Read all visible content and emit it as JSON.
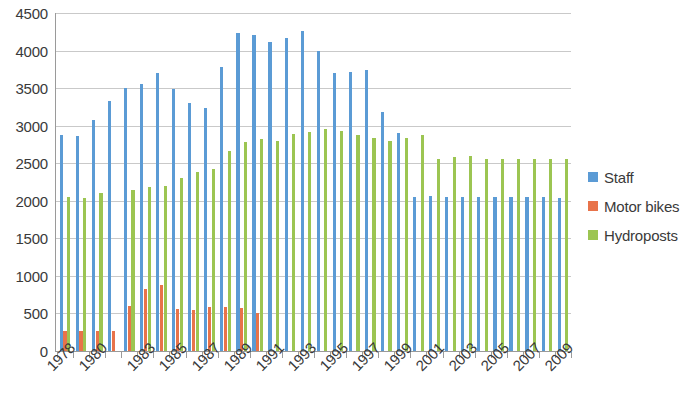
{
  "chart_data": {
    "type": "bar",
    "title": "",
    "subtitle": "",
    "xlabel": "",
    "ylabel": "",
    "ylim": [
      0,
      4500
    ],
    "ytick_step": 500,
    "yticks": [
      0,
      500,
      1000,
      1500,
      2000,
      2500,
      3000,
      3500,
      4000,
      4500
    ],
    "grid": true,
    "legend_position": "right",
    "x": [
      1978,
      1979,
      1980,
      1981,
      1982,
      1983,
      1984,
      1985,
      1986,
      1987,
      1988,
      1989,
      1990,
      1991,
      1992,
      1993,
      1994,
      1995,
      1996,
      1997,
      1998,
      1999,
      2000,
      2001,
      2002,
      2003,
      2004,
      2005,
      2006,
      2007,
      2008,
      2009
    ],
    "categories": [
      "1978",
      "1979",
      "1980",
      "1981",
      "1982",
      "1983",
      "1984",
      "1985",
      "1986",
      "1987",
      "1988",
      "1989",
      "1990",
      "1991",
      "1992",
      "1993",
      "1994",
      "1995",
      "1996",
      "1997",
      "1998",
      "1999",
      "2000",
      "2001",
      "2002",
      "2003",
      "2004",
      "2005",
      "2006",
      "2007",
      "2008",
      "2009"
    ],
    "xtick_labels": [
      "1978",
      "1980",
      "1983",
      "1985",
      "1987",
      "1989",
      "1991",
      "1993",
      "1995",
      "1997",
      "1999",
      "2001",
      "2003",
      "2005",
      "2007",
      "2009"
    ],
    "xtick_label_indices": [
      0,
      2,
      5,
      7,
      9,
      11,
      13,
      15,
      17,
      19,
      21,
      23,
      25,
      27,
      29,
      31
    ],
    "series": [
      {
        "name": "Staff",
        "color": "#5B9BD5",
        "values": [
          2880,
          2860,
          3080,
          3330,
          3500,
          3560,
          3700,
          3490,
          3300,
          3240,
          3780,
          4240,
          4210,
          4120,
          4170,
          4260,
          4000,
          3700,
          3720,
          3740,
          3180,
          2900,
          2050,
          2060,
          2050,
          2050,
          2050,
          2050,
          2050,
          2050,
          2050,
          2040
        ]
      },
      {
        "name": "Motor bikes",
        "color": "#E8734A",
        "values": [
          270,
          270,
          260,
          260,
          600,
          820,
          880,
          560,
          550,
          590,
          580,
          570,
          500,
          0,
          0,
          0,
          0,
          0,
          0,
          0,
          0,
          0,
          0,
          0,
          0,
          0,
          0,
          0,
          0,
          0,
          0,
          0
        ]
      },
      {
        "name": "Hydroposts",
        "color": "#9CC552",
        "values": [
          2050,
          2040,
          2100,
          0,
          2150,
          2180,
          2200,
          2300,
          2380,
          2420,
          2660,
          2780,
          2820,
          2800,
          2890,
          2920,
          2950,
          2930,
          2880,
          2830,
          2800,
          2830,
          2870,
          2560,
          2580,
          2600,
          2560,
          2560,
          2560,
          2560,
          2560,
          2550
        ]
      }
    ]
  },
  "legend": {
    "items": [
      {
        "label": "Staff",
        "color": "#5B9BD5"
      },
      {
        "label": "Motor bikes",
        "color": "#E8734A"
      },
      {
        "label": "Hydroposts",
        "color": "#9CC552"
      }
    ]
  }
}
